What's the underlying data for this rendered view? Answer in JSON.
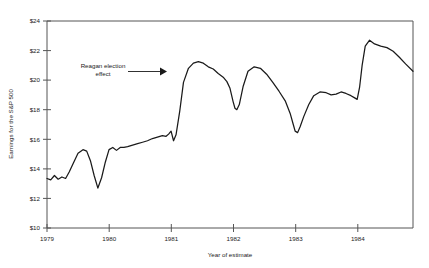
{
  "chart_data": {
    "type": "line",
    "title": "",
    "xlabel": "Year of estimate",
    "ylabel": "Earnings for the S&P 500",
    "xlim": [
      1979.0,
      1984.9
    ],
    "ylim": [
      10,
      24
    ],
    "grid": false,
    "legend": "none",
    "y_tick_labels": [
      "$24",
      "$22",
      "$20",
      "$18",
      "$16",
      "$14",
      "$12",
      "$10"
    ],
    "y_tick_values": [
      24,
      22,
      20,
      18,
      16,
      14,
      12,
      10
    ],
    "x_tick_labels": [
      "1979",
      "1980",
      "1981",
      "1982",
      "1983",
      "1984"
    ],
    "x_tick_values": [
      1979,
      1980,
      1981,
      1982,
      1983,
      1984
    ],
    "annotations": [
      {
        "text_line_1": "Reagan election",
        "text_line_2": "effect",
        "target_x": 1981.0,
        "target_y": 20.6
      }
    ],
    "series": [
      {
        "name": "Earnings for the S&P 500",
        "color": "#1a1a1a",
        "x": [
          1979.0,
          1979.06,
          1979.12,
          1979.18,
          1979.24,
          1979.3,
          1979.36,
          1979.42,
          1979.5,
          1979.58,
          1979.64,
          1979.7,
          1979.76,
          1979.82,
          1979.88,
          1979.94,
          1980.0,
          1980.06,
          1980.12,
          1980.18,
          1980.24,
          1980.3,
          1980.38,
          1980.46,
          1980.54,
          1980.62,
          1980.7,
          1980.78,
          1980.86,
          1980.92,
          1980.96,
          1981.0,
          1981.04,
          1981.08,
          1981.14,
          1981.2,
          1981.28,
          1981.36,
          1981.44,
          1981.52,
          1981.6,
          1981.68,
          1981.76,
          1981.84,
          1981.9,
          1981.95,
          1982.0,
          1982.03,
          1982.06,
          1982.1,
          1982.16,
          1982.24,
          1982.34,
          1982.44,
          1982.54,
          1982.64,
          1982.74,
          1982.84,
          1982.92,
          1982.97,
          1983.0,
          1983.04,
          1983.08,
          1983.14,
          1983.22,
          1983.3,
          1983.4,
          1983.5,
          1983.58,
          1983.66,
          1983.74,
          1983.82,
          1983.9,
          1983.96,
          1984.0,
          1984.04,
          1984.08,
          1984.13,
          1984.2,
          1984.28,
          1984.38,
          1984.48,
          1984.58,
          1984.68,
          1984.78,
          1984.9
        ],
        "y": [
          13.35,
          13.25,
          13.55,
          13.3,
          13.45,
          13.35,
          13.8,
          14.35,
          15.05,
          15.3,
          15.2,
          14.55,
          13.55,
          12.7,
          13.4,
          14.45,
          15.3,
          15.45,
          15.25,
          15.45,
          15.45,
          15.5,
          15.6,
          15.7,
          15.8,
          15.9,
          16.05,
          16.15,
          16.25,
          16.2,
          16.35,
          16.55,
          15.9,
          16.3,
          17.9,
          19.85,
          20.8,
          21.15,
          21.25,
          21.15,
          20.9,
          20.75,
          20.45,
          20.2,
          19.9,
          19.45,
          18.55,
          18.1,
          18.0,
          18.35,
          19.55,
          20.6,
          20.9,
          20.8,
          20.4,
          19.85,
          19.25,
          18.6,
          17.75,
          17.0,
          16.55,
          16.45,
          16.85,
          17.55,
          18.35,
          18.95,
          19.2,
          19.15,
          19.0,
          19.05,
          19.2,
          19.1,
          18.95,
          18.8,
          18.7,
          19.55,
          21.0,
          22.3,
          22.7,
          22.45,
          22.3,
          22.2,
          21.95,
          21.55,
          21.1,
          20.6
        ]
      }
    ]
  },
  "figure": {
    "background_color": "#ffffff",
    "axis_color": "#555555",
    "line_color": "#1a1a1a"
  }
}
